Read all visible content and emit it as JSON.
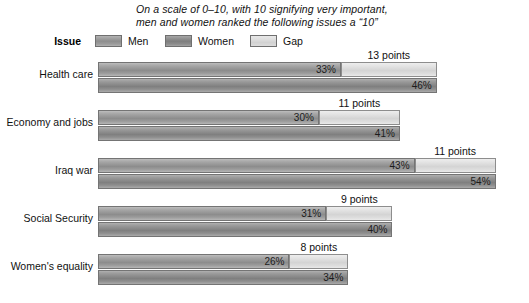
{
  "title": {
    "line1": "On a scale of 0–10, with 10 signifying very important,",
    "line2": "men and women ranked the following issues a “10”"
  },
  "legend": {
    "issue_header": "Issue",
    "items": [
      {
        "key": "men",
        "label": "Men",
        "color": "#999999"
      },
      {
        "key": "women",
        "label": "Women",
        "color": "#8c8c8c"
      },
      {
        "key": "gap",
        "label": "Gap",
        "color": "#d4d4d4"
      }
    ]
  },
  "rows": [
    {
      "category": "Health care",
      "men_label": "33%",
      "women_label": "46%",
      "gap_label": "13 points",
      "men": 33,
      "women": 46,
      "gap": 13
    },
    {
      "category": "Economy and jobs",
      "men_label": "30%",
      "women_label": "41%",
      "gap_label": "11 points",
      "men": 30,
      "women": 41,
      "gap": 11
    },
    {
      "category": "Iraq war",
      "men_label": "43%",
      "women_label": "54%",
      "gap_label": "11 points",
      "men": 43,
      "women": 54,
      "gap": 11
    },
    {
      "category": "Social Security",
      "men_label": "31%",
      "women_label": "40%",
      "gap_label": "9 points",
      "men": 31,
      "women": 40,
      "gap": 9
    },
    {
      "category": "Women's equality",
      "men_label": "26%",
      "women_label": "34%",
      "gap_label": "8 points",
      "men": 26,
      "women": 34,
      "gap": 8
    }
  ],
  "chart_data": {
    "type": "bar",
    "title": "On a scale of 0–10, with 10 signifying very important, men and women ranked the following issues a “10”",
    "orientation": "horizontal",
    "categories": [
      "Health care",
      "Economy and jobs",
      "Iraq war",
      "Social Security",
      "Women's equality"
    ],
    "series": [
      {
        "name": "Men",
        "values": [
          33,
          30,
          43,
          31,
          26
        ],
        "unit": "%"
      },
      {
        "name": "Women",
        "values": [
          46,
          41,
          54,
          40,
          34
        ],
        "unit": "%"
      },
      {
        "name": "Gap",
        "values": [
          13,
          11,
          11,
          9,
          8
        ],
        "unit": "points"
      }
    ],
    "data_labels": {
      "men": [
        "33%",
        "30%",
        "43%",
        "31%",
        "26%"
      ],
      "women": [
        "46%",
        "41%",
        "54%",
        "40%",
        "34%"
      ],
      "gap": [
        "13 points",
        "11 points",
        "11 points",
        "9 points",
        "8 points"
      ]
    },
    "xlabel": "",
    "ylabel": "Issue",
    "xlim": [
      0,
      58
    ],
    "grid": false,
    "axis_visible": false,
    "legend": {
      "position": "top",
      "entries": [
        "Men",
        "Women",
        "Gap"
      ]
    }
  }
}
